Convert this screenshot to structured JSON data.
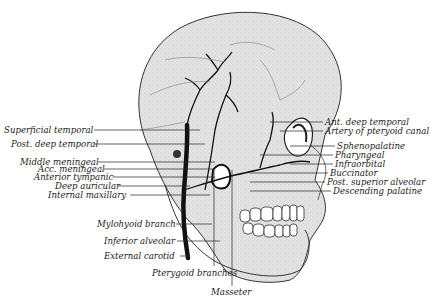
{
  "figure": {
    "colors": {
      "background": "#ffffff",
      "bone": "#dcdcdc",
      "artery": "#111111",
      "text": "#1a1a1a"
    }
  },
  "labels_left": [
    {
      "text": "Superficial temporal",
      "x": 4,
      "y": 125,
      "lx1": 94,
      "ly": 130,
      "lx2": 200
    },
    {
      "text": "Post. deep temporal",
      "x": 11,
      "y": 139,
      "lx1": 94,
      "ly": 144,
      "lx2": 205
    },
    {
      "text": "Middle meningeal",
      "x": 20,
      "y": 157,
      "lx1": 98,
      "ly": 162,
      "lx2": 215
    },
    {
      "text": "Acc. meningeal",
      "x": 38,
      "y": 164,
      "lx1": 104,
      "ly": 169,
      "lx2": 215
    },
    {
      "text": "Anterior tympanic",
      "x": 34,
      "y": 172,
      "lx1": 113,
      "ly": 177,
      "lx2": 215
    },
    {
      "text": "Deep auricular",
      "x": 55,
      "y": 181,
      "lx1": 118,
      "ly": 186,
      "lx2": 190
    },
    {
      "text": "Internal maxillary",
      "x": 48,
      "y": 190,
      "lx1": 130,
      "ly": 195,
      "lx2": 210
    },
    {
      "text": "Mylohyoid branch",
      "x": 97,
      "y": 219,
      "lx1": 176,
      "ly": 224,
      "lx2": 212
    },
    {
      "text": "Inferior alveolar",
      "x": 104,
      "y": 236,
      "lx1": 177,
      "ly": 241,
      "lx2": 220
    },
    {
      "text": "External carotid",
      "x": 104,
      "y": 251,
      "lx1": 180,
      "ly": 256,
      "lx2": 190
    }
  ],
  "labels_right": [
    {
      "text": "Ant. deep temporal",
      "x": 325,
      "y": 117,
      "lx1": 270,
      "ly": 122,
      "lx2": 323
    },
    {
      "text": "Artery of pteryoid canal",
      "x": 325,
      "y": 126,
      "lx1": 280,
      "ly": 131,
      "lx2": 323
    },
    {
      "text": "Sphenopalatine",
      "x": 337,
      "y": 141,
      "lx1": 290,
      "ly": 146,
      "lx2": 335
    },
    {
      "text": "Pharyngeal",
      "x": 335,
      "y": 150,
      "lx1": 260,
      "ly": 155,
      "lx2": 333
    },
    {
      "text": "Infraorbital",
      "x": 335,
      "y": 159,
      "lx1": 290,
      "ly": 164,
      "lx2": 333
    },
    {
      "text": "Buccinator",
      "x": 330,
      "y": 168,
      "lx1": 250,
      "ly": 173,
      "lx2": 328
    },
    {
      "text": "Post. superior alveolar",
      "x": 327,
      "y": 177,
      "lx1": 250,
      "ly": 182,
      "lx2": 325
    },
    {
      "text": "Descending palatine",
      "x": 333,
      "y": 186,
      "lx1": 250,
      "ly": 191,
      "lx2": 331
    }
  ],
  "labels_bottom": [
    {
      "text": "Pterygoid branches",
      "x": 152,
      "y": 268
    },
    {
      "text": "Masseter",
      "x": 211,
      "y": 287
    }
  ]
}
